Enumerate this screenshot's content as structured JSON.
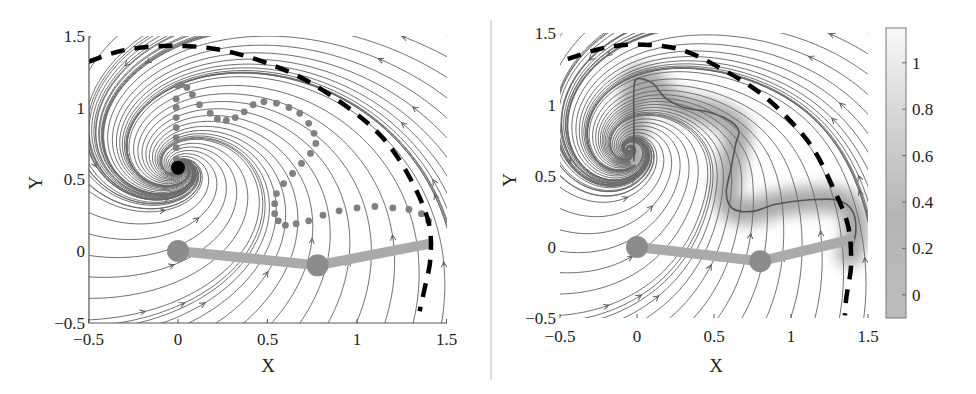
{
  "chart_data": [
    {
      "type": "streamline",
      "panel": "left",
      "title": "",
      "xlabel": "X",
      "ylabel": "Y",
      "xlim": [
        -0.5,
        1.5
      ],
      "ylim": [
        -0.5,
        1.5
      ],
      "xticks": [
        "-0.5",
        "0",
        "0.5",
        "1",
        "1.5"
      ],
      "yticks": [
        "-0.5",
        "0",
        "0.5",
        "1",
        "1.5"
      ],
      "grid": false,
      "attractor": {
        "x": 0.0,
        "y": 0.58,
        "color": "#000000"
      },
      "demonstration_points": [
        [
          0.0,
          1.15
        ],
        [
          0.02,
          1.16
        ],
        [
          0.05,
          1.14
        ],
        [
          0.08,
          1.09
        ],
        [
          -0.01,
          1.06
        ],
        [
          -0.01,
          1.0
        ],
        [
          -0.01,
          0.93
        ],
        [
          -0.01,
          0.86
        ],
        [
          -0.01,
          0.79
        ],
        [
          -0.01,
          0.72
        ],
        [
          -0.01,
          0.64
        ],
        [
          0.12,
          1.02
        ],
        [
          0.18,
          0.96
        ],
        [
          0.22,
          0.92
        ],
        [
          0.27,
          0.91
        ],
        [
          0.32,
          0.93
        ],
        [
          0.37,
          0.97
        ],
        [
          0.42,
          1.02
        ],
        [
          0.48,
          1.04
        ],
        [
          0.55,
          1.03
        ],
        [
          0.62,
          1.0
        ],
        [
          0.68,
          0.96
        ],
        [
          0.73,
          0.89
        ],
        [
          0.76,
          0.82
        ],
        [
          0.77,
          0.75
        ],
        [
          0.74,
          0.68
        ],
        [
          0.69,
          0.61
        ],
        [
          0.64,
          0.54
        ],
        [
          0.59,
          0.47
        ],
        [
          0.55,
          0.4
        ],
        [
          0.54,
          0.33
        ],
        [
          0.54,
          0.26
        ],
        [
          0.56,
          0.21
        ],
        [
          0.6,
          0.18
        ],
        [
          0.66,
          0.19
        ],
        [
          0.73,
          0.21
        ],
        [
          0.81,
          0.25
        ],
        [
          0.9,
          0.28
        ],
        [
          1.0,
          0.3
        ],
        [
          1.1,
          0.31
        ],
        [
          1.2,
          0.3
        ],
        [
          1.29,
          0.29
        ],
        [
          1.36,
          0.26
        ],
        [
          1.4,
          0.21
        ]
      ],
      "boundary": {
        "style": "dashed",
        "color": "#000000",
        "path": [
          [
            -0.5,
            1.32
          ],
          [
            -0.3,
            1.4
          ],
          [
            -0.05,
            1.43
          ],
          [
            0.2,
            1.41
          ],
          [
            0.45,
            1.33
          ],
          [
            0.7,
            1.2
          ],
          [
            0.95,
            1.0
          ],
          [
            1.15,
            0.78
          ],
          [
            1.3,
            0.5
          ],
          [
            1.4,
            0.2
          ],
          [
            1.41,
            -0.05
          ],
          [
            1.38,
            -0.25
          ],
          [
            1.35,
            -0.42
          ]
        ]
      },
      "robot_arm": {
        "color": "#aaaaaa",
        "joints": [
          [
            0.0,
            0.0
          ],
          [
            0.78,
            -0.1
          ],
          [
            1.4,
            0.05
          ]
        ]
      }
    },
    {
      "type": "streamline",
      "panel": "right",
      "title": "",
      "xlabel": "X",
      "ylabel": "Y",
      "xlim": [
        -0.5,
        1.5
      ],
      "ylim": [
        -0.5,
        1.5
      ],
      "xticks": [
        "-0.5",
        "0",
        "0.5",
        "1",
        "1.5"
      ],
      "yticks": [
        "-0.5",
        "0",
        "0.5",
        "1",
        "1.5"
      ],
      "grid": false,
      "attractor": {
        "x": -0.02,
        "y": 0.6
      },
      "learned_trajectory": [
        [
          1.38,
          -0.05
        ],
        [
          1.42,
          0.1
        ],
        [
          1.4,
          0.25
        ],
        [
          1.3,
          0.33
        ],
        [
          1.1,
          0.33
        ],
        [
          0.9,
          0.3
        ],
        [
          0.75,
          0.25
        ],
        [
          0.62,
          0.27
        ],
        [
          0.58,
          0.38
        ],
        [
          0.61,
          0.55
        ],
        [
          0.64,
          0.72
        ],
        [
          0.66,
          0.82
        ],
        [
          0.58,
          0.9
        ],
        [
          0.45,
          0.95
        ],
        [
          0.3,
          0.98
        ],
        [
          0.18,
          1.05
        ],
        [
          0.1,
          1.15
        ],
        [
          0.0,
          1.18
        ],
        [
          -0.02,
          1.1
        ],
        [
          -0.02,
          0.9
        ],
        [
          -0.02,
          0.6
        ]
      ],
      "boundary": {
        "style": "dashed",
        "color": "#000000",
        "path": [
          [
            -0.45,
            1.32
          ],
          [
            -0.2,
            1.4
          ],
          [
            0.05,
            1.42
          ],
          [
            0.3,
            1.38
          ],
          [
            0.55,
            1.25
          ],
          [
            0.8,
            1.08
          ],
          [
            1.0,
            0.88
          ],
          [
            1.15,
            0.68
          ],
          [
            1.28,
            0.4
          ],
          [
            1.37,
            0.15
          ],
          [
            1.39,
            -0.12
          ],
          [
            1.36,
            -0.35
          ],
          [
            1.35,
            -0.48
          ]
        ]
      },
      "robot_arm": {
        "color": "#aaaaaa",
        "joints": [
          [
            0.0,
            0.0
          ],
          [
            0.8,
            -0.1
          ],
          [
            1.38,
            0.05
          ]
        ]
      },
      "colorbar": {
        "ticks": [
          "0",
          "0.2",
          "0.4",
          "0.6",
          "0.8",
          "1"
        ],
        "range": [
          -0.1,
          1.15
        ],
        "colormap": "gray-to-white"
      }
    }
  ],
  "labels": {
    "left_xlabel": "X",
    "left_ylabel": "Y",
    "right_xlabel": "X",
    "right_ylabel": "Y"
  }
}
